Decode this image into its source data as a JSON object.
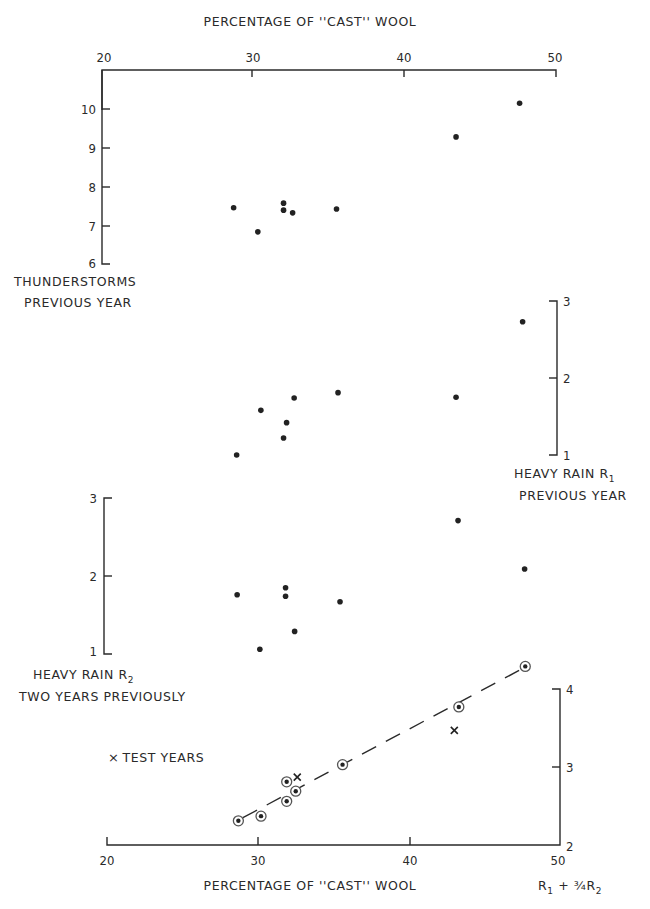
{
  "chart_data": [
    {
      "type": "scatter",
      "panel": "thunderstorms",
      "title": "",
      "xlabel": "PERCENTAGE OF \"CAST\" WOOL",
      "ylabel": "THUNDERSTORMS PREVIOUS YEAR",
      "xlim": [
        20,
        50
      ],
      "ylim": [
        6,
        10
      ],
      "x_ticks": [
        20,
        30,
        40,
        50
      ],
      "y_ticks": [
        6,
        7,
        8,
        9,
        10
      ],
      "axis_side": "left",
      "points": [
        {
          "x": 28.7,
          "y": 7.45
        },
        {
          "x": 30.3,
          "y": 6.83
        },
        {
          "x": 32.0,
          "y": 7.57
        },
        {
          "x": 32.0,
          "y": 7.39
        },
        {
          "x": 32.6,
          "y": 7.32
        },
        {
          "x": 35.5,
          "y": 7.42
        },
        {
          "x": 43.4,
          "y": 9.28
        },
        {
          "x": 47.6,
          "y": 10.15
        }
      ]
    },
    {
      "type": "scatter",
      "panel": "heavy-rain-r1",
      "ylabel": "HEAVY RAIN R1 PREVIOUS YEAR",
      "xlim": [
        20,
        50
      ],
      "ylim": [
        1,
        3
      ],
      "y_ticks": [
        1,
        2,
        3
      ],
      "axis_side": "right",
      "points": [
        {
          "x": 28.9,
          "y": 1.0
        },
        {
          "x": 30.5,
          "y": 1.58
        },
        {
          "x": 32.0,
          "y": 1.22
        },
        {
          "x": 32.2,
          "y": 1.42
        },
        {
          "x": 32.7,
          "y": 1.74
        },
        {
          "x": 35.6,
          "y": 1.81
        },
        {
          "x": 43.4,
          "y": 1.75
        },
        {
          "x": 47.8,
          "y": 2.73
        }
      ]
    },
    {
      "type": "scatter",
      "panel": "heavy-rain-r2",
      "ylabel": "HEAVY RAIN R2 TWO YEARS PREVIOUSLY",
      "xlim": [
        20,
        50
      ],
      "ylim": [
        1,
        3
      ],
      "y_ticks": [
        1,
        2,
        3
      ],
      "axis_side": "left",
      "points": [
        {
          "x": 28.8,
          "y": 1.76
        },
        {
          "x": 30.3,
          "y": 1.06
        },
        {
          "x": 32.0,
          "y": 1.85
        },
        {
          "x": 32.0,
          "y": 1.74
        },
        {
          "x": 32.6,
          "y": 1.29
        },
        {
          "x": 35.6,
          "y": 1.67
        },
        {
          "x": 43.4,
          "y": 2.71
        },
        {
          "x": 47.8,
          "y": 2.09
        }
      ]
    },
    {
      "type": "scatter",
      "panel": "combined-rain",
      "xlabel": "PERCENTAGE OF \"CAST\" WOOL",
      "ylabel": "R1 + ¾R2",
      "xlim": [
        20,
        50
      ],
      "ylim": [
        2,
        4
      ],
      "x_ticks": [
        20,
        30,
        40,
        50
      ],
      "y_ticks": [
        2,
        3,
        4
      ],
      "axis_side": "right",
      "legend": "× TEST YEARS",
      "series": [
        {
          "name": "observed years (circled)",
          "marker": "circled-dot",
          "points": [
            {
              "x": 28.7,
              "y": 2.31
            },
            {
              "x": 30.2,
              "y": 2.37
            },
            {
              "x": 31.9,
              "y": 2.56
            },
            {
              "x": 31.9,
              "y": 2.81
            },
            {
              "x": 32.5,
              "y": 2.69
            },
            {
              "x": 35.6,
              "y": 3.03
            },
            {
              "x": 43.3,
              "y": 3.77
            },
            {
              "x": 47.7,
              "y": 4.29
            }
          ]
        },
        {
          "name": "test years",
          "marker": "x",
          "points": [
            {
              "x": 32.6,
              "y": 2.87
            },
            {
              "x": 43.0,
              "y": 3.47
            }
          ]
        }
      ],
      "trend_line": {
        "style": "dashed",
        "from": {
          "x": 29.0,
          "y": 2.35
        },
        "to": {
          "x": 47.6,
          "y": 4.27
        }
      }
    }
  ],
  "labels": {
    "top_axis_title": "PERCENTAGE OF ''CAST'' WOOL",
    "bottom_axis_title": "PERCENTAGE OF ''CAST'' WOOL",
    "x_tick_labels": [
      "20",
      "30",
      "40",
      "50"
    ],
    "thunder_ticks": [
      "10",
      "9",
      "8",
      "7",
      "6"
    ],
    "thunder_line1": "THUNDERSTORMS",
    "thunder_line2": "PREVIOUS YEAR",
    "r1_ticks": [
      "3",
      "2",
      "1"
    ],
    "r1_line1": "HEAVY RAIN R",
    "r1_sub": "1",
    "r1_line2": "PREVIOUS YEAR",
    "r2_ticks": [
      "3",
      "2",
      "1"
    ],
    "r2_line1": "HEAVY RAIN R",
    "r2_sub": "2",
    "r2_line2": "TWO YEARS PREVIOUSLY",
    "combo_ticks": [
      "4",
      "3",
      "2"
    ],
    "combo_R": "R",
    "combo_sub1": "1",
    "combo_plus": " + ¾R",
    "combo_sub2": "2",
    "legend_marker": "×",
    "legend_text": "TEST YEARS"
  }
}
